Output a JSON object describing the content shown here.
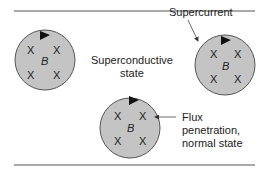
{
  "diagram": {
    "labels": {
      "superconductive_state": [
        "Superconductive",
        "state"
      ],
      "supercurrent": "Supercurrent",
      "flux_penetration": [
        "Flux",
        "penetration,",
        "normal state"
      ]
    },
    "circles": [
      {
        "id": "left",
        "field_label": "B",
        "markers": [
          "X",
          "X",
          "X",
          "X"
        ]
      },
      {
        "id": "right",
        "field_label": "B",
        "markers": [
          "X",
          "X",
          "X",
          "X"
        ]
      },
      {
        "id": "bottom",
        "field_label": "B",
        "markers": [
          "X",
          "X",
          "X",
          "X"
        ]
      }
    ],
    "colors": {
      "circle_fill": "#c4c4c4",
      "stroke": "#555555",
      "text": "#222222"
    }
  }
}
